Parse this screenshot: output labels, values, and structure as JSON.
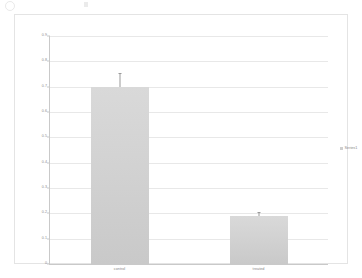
{
  "chart_data": {
    "type": "bar",
    "title": "",
    "xlabel": "",
    "ylabel": "",
    "categories": [
      "control",
      "treated"
    ],
    "values": [
      0.7,
      0.19
    ],
    "errors": [
      0.055,
      0.015
    ],
    "series": [
      {
        "name": "Series1",
        "values": [
          0.7,
          0.19
        ]
      }
    ],
    "ylim": [
      0,
      0.9
    ],
    "ytick_step": 0.1,
    "yticks": [
      "0.9",
      "0.8",
      "0.7",
      "0.6",
      "0.5",
      "0.4",
      "0.3",
      "0.2",
      "0.1",
      "0"
    ],
    "ytick_values": [
      0.9,
      0.8,
      0.7,
      0.6,
      0.5,
      0.4,
      0.3,
      0.2,
      0.1,
      0
    ],
    "grid": true,
    "legend_position": "right",
    "bar_color": "#d2d2d2",
    "gridline_color": "#e8e8e8",
    "axis_color": "#c9c9c9",
    "text_color": "#8a8a8a"
  },
  "legend": {
    "entries": [
      {
        "label": "Series1",
        "color": "#cfcfcf"
      }
    ]
  }
}
